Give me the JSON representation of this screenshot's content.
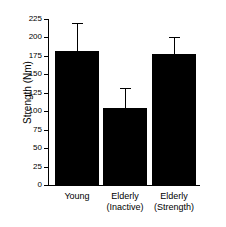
{
  "chart_data": {
    "type": "bar",
    "title": "",
    "xlabel": "",
    "ylabel": "Strength (Nm)",
    "categories": [
      "Young",
      "Elderly\n(Inactive)",
      "Elderly\n(Strength)"
    ],
    "category_labels_flat": [
      "Young",
      "Elderly (Inactive)",
      "Elderly (Strength)"
    ],
    "values": [
      181,
      105,
      177
    ],
    "errors_upper": [
      220,
      131,
      200
    ],
    "error_magnitudes": [
      39,
      26,
      23
    ],
    "ylim": [
      0,
      225
    ],
    "yticks": [
      0,
      25,
      50,
      75,
      100,
      125,
      150,
      175,
      200,
      225
    ],
    "ytick_labels": [
      "0",
      "25",
      "50",
      "75",
      "100",
      "125",
      "150",
      "175",
      "200",
      "225"
    ],
    "grid": false,
    "legend": null,
    "bar_color": "#000000",
    "axis_color": "#000000",
    "background_color": "#ffffff",
    "error_bar_direction": "upper-only"
  }
}
